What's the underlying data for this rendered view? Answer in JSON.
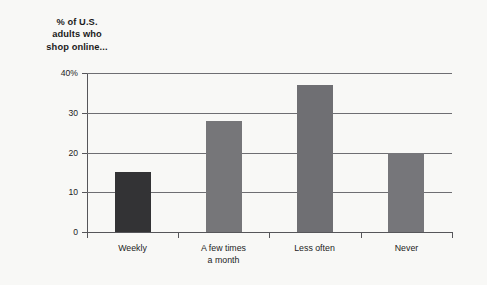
{
  "chart_data": {
    "type": "bar",
    "title": "% of U.S. adults who shop online...",
    "title_lines": [
      "% of U.S.",
      "adults who",
      "shop online..."
    ],
    "categories": [
      "Weekly",
      "A few times a month",
      "Less often",
      "Never"
    ],
    "category_lines": [
      [
        "Weekly"
      ],
      [
        "A few times",
        "a month"
      ],
      [
        "Less often"
      ],
      [
        "Never"
      ]
    ],
    "values": [
      15,
      28,
      37,
      20
    ],
    "xlabel": "",
    "ylabel": "",
    "ylim": [
      0,
      40
    ],
    "yticks": [
      0,
      10,
      20,
      30,
      40
    ],
    "ytick_labels": [
      "0",
      "10",
      "20",
      "30",
      "40%"
    ],
    "grid": true,
    "legend": false,
    "bar_colors": [
      "#333335",
      "#767679",
      "#6f6f73",
      "#76767a"
    ],
    "accent_color": "#333335",
    "series_color": "#767679",
    "axis_color": "#56565a",
    "background": "#f8f8f6"
  }
}
